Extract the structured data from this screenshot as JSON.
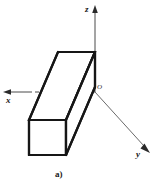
{
  "figure": {
    "caption": "a)",
    "background_color": "#ffffff",
    "line_color": "#1a1a1a",
    "axis_color": "#3c3c3c",
    "hidden_line_color": "#8c8c8c",
    "axes": [
      {
        "name": "z-axis",
        "label": "z",
        "direction": "up",
        "arrow": true
      },
      {
        "name": "x-axis",
        "label": "x",
        "direction": "left",
        "arrow": true
      },
      {
        "name": "y-axis",
        "label": "y",
        "direction": "down-right",
        "arrow": true
      }
    ],
    "origin": {
      "label": "O",
      "x": 95,
      "y": 92
    },
    "solid": {
      "name": "rectangular-prism",
      "kind": "beam",
      "visible_faces": [
        "front",
        "top",
        "right"
      ],
      "hidden_edges": 3
    },
    "labels": {
      "z": "z",
      "x": "x",
      "y": "y",
      "origin": "O",
      "caption": "a)"
    }
  }
}
